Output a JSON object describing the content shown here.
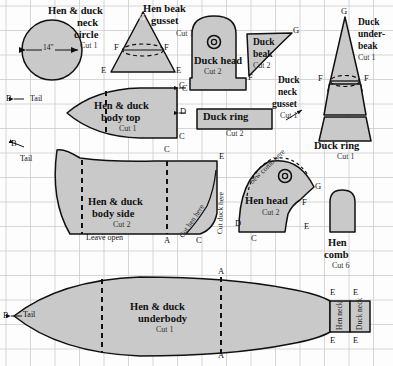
{
  "diagram": {
    "grid": {
      "cell_px": 24.5,
      "line_color": "#c9c9c9",
      "background": "#fdfdfd"
    },
    "style": {
      "piece_fill": "#c9c9c9",
      "piece_stroke": "#111111",
      "dash_stroke": "#111111"
    }
  },
  "pieces": {
    "neck_circle": {
      "title_line1": "Hen & duck",
      "title_line2": "neck",
      "title_line3": "circle",
      "cut": "Cut 1",
      "dimension": "14\""
    },
    "hen_beak_gusset": {
      "title_line1": "Hen beak",
      "title_line2": "gusset",
      "cut": "Cut 1",
      "points": {
        "apex": "G",
        "left_mid": "F",
        "right_mid": "F",
        "left_base": "E",
        "right_base": "E"
      }
    },
    "duck_head": {
      "title": "Duck head",
      "cut": "Cut 2",
      "points": {
        "left_bottom": "C"
      }
    },
    "duck_beak": {
      "title_line1": "Duck",
      "title_line2": "beak",
      "cut": "Cut 2",
      "points": {
        "tip": "G",
        "bottom": "F"
      }
    },
    "duck_under_beak": {
      "title_line1": "Duck",
      "title_line2": "under-",
      "title_line3": "beak",
      "cut": "Cut 1",
      "points": {
        "apex": "G",
        "left_mid": "F",
        "right_mid": "F"
      }
    },
    "duck_neck_gusset": {
      "title_line1": "Duck",
      "title_line2": "neck",
      "title_line3": "gusset",
      "cut": "Cut 1"
    },
    "duck_ring_small": {
      "title": "Duck ring",
      "cut": "Cut 2"
    },
    "duck_ring_large": {
      "title": "Duck ring",
      "cut": "Cut 1"
    },
    "body_top": {
      "title_line1": "Hen & duck",
      "title_line2": "body top",
      "cut": "Cut 1",
      "points": {
        "tail": "B",
        "top_right": "C",
        "mid_right": "D",
        "bottom_right": "C"
      },
      "tail_label": "Tail"
    },
    "body_side": {
      "title_line1": "Hen & duck",
      "title_line2": "body side",
      "cut": "Cut 2",
      "note": "Leave open",
      "tail_label": "Tail",
      "points": {
        "tail": "B",
        "top_mid": "C",
        "top_right": "E",
        "bottom_mid": "A",
        "bottom_right": "C"
      },
      "cut_hen_label": "Cut hen here",
      "cut_duck_label": "Cut duck here"
    },
    "hen_head": {
      "title": "Hen head",
      "cut": "Cut 2",
      "sew_note": "Sew comb here",
      "points": {
        "left": "D",
        "bottom_left": "C",
        "right_top": "G",
        "right_mid": "F",
        "bottom_right": "E"
      }
    },
    "hen_comb": {
      "title_line1": "Hen",
      "title_line2": "comb",
      "cut": "Cut 6"
    },
    "underbody": {
      "title_line1": "Hen & duck",
      "title_line2": "underbody",
      "cut": "Cut 1",
      "tail_label": "Tail",
      "points": {
        "tail": "B",
        "top_mid": "A",
        "bottom_mid": "A",
        "hen_top": "E",
        "duck_top": "E",
        "hen_bottom": "E",
        "duck_bottom": "E"
      },
      "hen_neck_label": "Hen neck",
      "duck_neck_label": "Duck neck"
    }
  }
}
